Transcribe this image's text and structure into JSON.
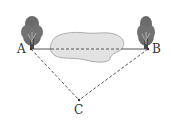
{
  "diagram": {
    "points": {
      "A": {
        "label": "A",
        "x": 31,
        "y": 49
      },
      "B": {
        "label": "B",
        "x": 148,
        "y": 49
      },
      "C": {
        "label": "C",
        "x": 79,
        "y": 100
      }
    },
    "segments": [
      {
        "from": "A",
        "to": "B",
        "style": "solid-outside-pond, dashed-over-pond"
      },
      {
        "from": "A",
        "to": "C",
        "style": "dashed"
      },
      {
        "from": "B",
        "to": "C",
        "style": "dashed"
      }
    ],
    "objects": [
      {
        "name": "tree",
        "at": "A"
      },
      {
        "name": "tree",
        "at": "B"
      },
      {
        "name": "pond",
        "between": [
          "A",
          "B"
        ]
      }
    ],
    "colors": {
      "line": "#555555",
      "tree": "#6b6b6b",
      "trunk": "#4a4a4a",
      "pond_fill": "#e2e2e2",
      "pond_stroke": "#9a9a9a"
    }
  }
}
